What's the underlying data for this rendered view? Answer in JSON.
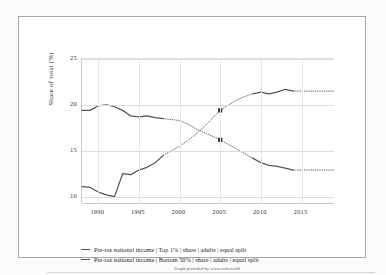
{
  "chart_data": {
    "type": "line",
    "title": "",
    "xlabel": "",
    "ylabel": "Share of total (%)",
    "xlim": [
      1988,
      2019
    ],
    "ylim": [
      9.2,
      25
    ],
    "yticks": [
      10,
      15,
      20,
      25
    ],
    "xticks": [
      1990,
      1995,
      2000,
      2005,
      2010,
      2015
    ],
    "grid": true,
    "legend_position": "bottom",
    "attribution": "Graph provided by www.wid.world",
    "series": [
      {
        "name": "Pre-tax national income | Top 1% | share | adults | equal split",
        "color": "#555555",
        "marker_years": [
          2005
        ],
        "marker_values": [
          19.4
        ],
        "points": [
          {
            "x": 1988,
            "y": 11.1,
            "dotted": false
          },
          {
            "x": 1989,
            "y": 11.0,
            "dotted": false
          },
          {
            "x": 1990,
            "y": 10.5,
            "dotted": false
          },
          {
            "x": 1991,
            "y": 10.2,
            "dotted": false
          },
          {
            "x": 1992,
            "y": 10.0,
            "dotted": false
          },
          {
            "x": 1993,
            "y": 12.5,
            "dotted": false
          },
          {
            "x": 1994,
            "y": 12.4,
            "dotted": false
          },
          {
            "x": 1995,
            "y": 12.9,
            "dotted": false
          },
          {
            "x": 1996,
            "y": 13.2,
            "dotted": false
          },
          {
            "x": 1997,
            "y": 13.7,
            "dotted": false
          },
          {
            "x": 1998,
            "y": 14.5,
            "dotted": false
          },
          {
            "x": 1999,
            "y": 15.0,
            "dotted": true
          },
          {
            "x": 2000,
            "y": 15.5,
            "dotted": true
          },
          {
            "x": 2001,
            "y": 16.1,
            "dotted": true
          },
          {
            "x": 2002,
            "y": 16.8,
            "dotted": true
          },
          {
            "x": 2003,
            "y": 17.6,
            "dotted": true
          },
          {
            "x": 2004,
            "y": 18.5,
            "dotted": true
          },
          {
            "x": 2005,
            "y": 19.4,
            "dotted": true
          },
          {
            "x": 2006,
            "y": 20.0,
            "dotted": true
          },
          {
            "x": 2007,
            "y": 20.5,
            "dotted": true
          },
          {
            "x": 2008,
            "y": 20.9,
            "dotted": true
          },
          {
            "x": 2009,
            "y": 21.2,
            "dotted": true
          },
          {
            "x": 2010,
            "y": 21.4,
            "dotted": false
          },
          {
            "x": 2011,
            "y": 21.2,
            "dotted": false
          },
          {
            "x": 2012,
            "y": 21.4,
            "dotted": false
          },
          {
            "x": 2013,
            "y": 21.7,
            "dotted": false
          },
          {
            "x": 2014,
            "y": 21.5,
            "dotted": false
          },
          {
            "x": 2015,
            "y": 21.5,
            "dotted": true
          },
          {
            "x": 2016,
            "y": 21.5,
            "dotted": true
          },
          {
            "x": 2017,
            "y": 21.5,
            "dotted": true
          },
          {
            "x": 2018,
            "y": 21.5,
            "dotted": true
          },
          {
            "x": 2019,
            "y": 21.5,
            "dotted": true
          }
        ]
      },
      {
        "name": "Pre-tax national income | Bottom 50% | share | adults | equal split",
        "color": "#555555",
        "marker_years": [
          2005
        ],
        "marker_values": [
          16.2
        ],
        "points": [
          {
            "x": 1988,
            "y": 19.4,
            "dotted": false
          },
          {
            "x": 1989,
            "y": 19.4,
            "dotted": false
          },
          {
            "x": 1990,
            "y": 19.9,
            "dotted": false
          },
          {
            "x": 1991,
            "y": 20.0,
            "dotted": false
          },
          {
            "x": 1992,
            "y": 19.8,
            "dotted": false
          },
          {
            "x": 1993,
            "y": 19.4,
            "dotted": false
          },
          {
            "x": 1994,
            "y": 18.8,
            "dotted": false
          },
          {
            "x": 1995,
            "y": 18.7,
            "dotted": false
          },
          {
            "x": 1996,
            "y": 18.8,
            "dotted": false
          },
          {
            "x": 1997,
            "y": 18.6,
            "dotted": false
          },
          {
            "x": 1998,
            "y": 18.5,
            "dotted": false
          },
          {
            "x": 1999,
            "y": 18.4,
            "dotted": true
          },
          {
            "x": 2000,
            "y": 18.3,
            "dotted": true
          },
          {
            "x": 2001,
            "y": 17.9,
            "dotted": true
          },
          {
            "x": 2002,
            "y": 17.4,
            "dotted": true
          },
          {
            "x": 2003,
            "y": 17.0,
            "dotted": true
          },
          {
            "x": 2004,
            "y": 16.6,
            "dotted": true
          },
          {
            "x": 2005,
            "y": 16.2,
            "dotted": true
          },
          {
            "x": 2006,
            "y": 15.7,
            "dotted": true
          },
          {
            "x": 2007,
            "y": 15.2,
            "dotted": true
          },
          {
            "x": 2008,
            "y": 14.7,
            "dotted": true
          },
          {
            "x": 2009,
            "y": 14.2,
            "dotted": true
          },
          {
            "x": 2010,
            "y": 13.7,
            "dotted": false
          },
          {
            "x": 2011,
            "y": 13.4,
            "dotted": false
          },
          {
            "x": 2012,
            "y": 13.3,
            "dotted": false
          },
          {
            "x": 2013,
            "y": 13.1,
            "dotted": false
          },
          {
            "x": 2014,
            "y": 12.9,
            "dotted": false
          },
          {
            "x": 2015,
            "y": 12.9,
            "dotted": true
          },
          {
            "x": 2016,
            "y": 12.9,
            "dotted": true
          },
          {
            "x": 2017,
            "y": 12.9,
            "dotted": true
          },
          {
            "x": 2018,
            "y": 12.9,
            "dotted": true
          },
          {
            "x": 2019,
            "y": 12.9,
            "dotted": true
          }
        ]
      }
    ]
  },
  "legend": {
    "items": [
      {
        "label": "Pre-tax national income | Top 1% | share | adults | equal split"
      },
      {
        "label": "Pre-tax national income | Bottom 50% | share | adults | equal split"
      }
    ]
  },
  "footer": {
    "attribution": "Graph provided by www.wid.world"
  }
}
